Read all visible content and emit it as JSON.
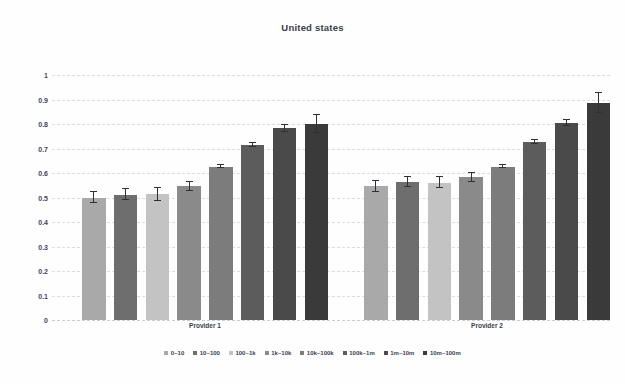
{
  "chart_data": {
    "type": "bar",
    "title": "United states",
    "xlabel": "",
    "ylabel": "",
    "ylim": [
      0,
      1
    ],
    "ytick_labels": [
      "1",
      "0.9",
      "0.8",
      "0.7",
      "0.6",
      "0.5",
      "0.4",
      "0.3",
      "0.2",
      "0.1",
      "0"
    ],
    "ytick_values": [
      1,
      0.9,
      0.8,
      0.7,
      0.6,
      0.5,
      0.4,
      0.3,
      0.2,
      0.1,
      0
    ],
    "grid": true,
    "legend_position": "bottom",
    "categories": [
      "Provider 1",
      "Provider 2"
    ],
    "series": [
      {
        "name": "0~10",
        "color": "#a9a9a9",
        "values": [
          0.5,
          0.545
        ],
        "errors": [
          0.022,
          0.023
        ]
      },
      {
        "name": "10~100",
        "color": "#6e6e6e",
        "values": [
          0.512,
          0.562
        ],
        "errors": [
          0.022,
          0.02
        ]
      },
      {
        "name": "100~1k",
        "color": "#c3c3c3",
        "values": [
          0.513,
          0.56
        ],
        "errors": [
          0.026,
          0.022
        ]
      },
      {
        "name": "1k~10k",
        "color": "#8a8a8a",
        "values": [
          0.545,
          0.582
        ],
        "errors": [
          0.018,
          0.018
        ]
      },
      {
        "name": "10k~100k",
        "color": "#7c7c7c",
        "values": [
          0.625,
          0.626
        ],
        "errors": [
          0.006,
          0.007
        ]
      },
      {
        "name": "100k~1m",
        "color": "#5c5c5c",
        "values": [
          0.716,
          0.726
        ],
        "errors": [
          0.008,
          0.008
        ]
      },
      {
        "name": "1m~10m",
        "color": "#4a4a4a",
        "values": [
          0.782,
          0.805
        ],
        "errors": [
          0.015,
          0.013
        ]
      },
      {
        "name": "10m~100m",
        "color": "#3a3a3a",
        "values": [
          0.8,
          0.885
        ],
        "errors": [
          0.038,
          0.042
        ]
      }
    ]
  }
}
